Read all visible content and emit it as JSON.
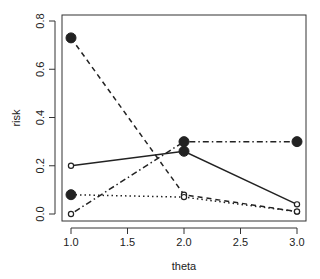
{
  "chart_data": {
    "type": "line",
    "title": "",
    "xlabel": "theta",
    "ylabel": "risk",
    "x": [
      1.0,
      2.0,
      3.0
    ],
    "xlim": [
      1.0,
      3.0
    ],
    "ylim": [
      0.0,
      0.8
    ],
    "xticks": [
      "1.0",
      "1.5",
      "2.0",
      "2.5",
      "3.0"
    ],
    "yticks": [
      "0.0",
      "0.2",
      "0.4",
      "0.6",
      "0.8"
    ],
    "grid": false,
    "legend": "none",
    "series": [
      {
        "name": "dashed",
        "linestyle": "dashed",
        "values": [
          0.73,
          0.08,
          0.01
        ],
        "markers": [
          "filled",
          "open",
          "open"
        ]
      },
      {
        "name": "solid",
        "linestyle": "solid",
        "values": [
          0.2,
          0.26,
          0.04
        ],
        "markers": [
          "open",
          "filled",
          "open"
        ]
      },
      {
        "name": "dotdash",
        "linestyle": "dotdash",
        "values": [
          0.0,
          0.3,
          0.3
        ],
        "markers": [
          "open",
          "filled",
          "filled"
        ]
      },
      {
        "name": "dotted",
        "linestyle": "dotted",
        "values": [
          0.08,
          0.07,
          0.01
        ],
        "markers": [
          "filled",
          "open",
          "open"
        ]
      }
    ]
  }
}
